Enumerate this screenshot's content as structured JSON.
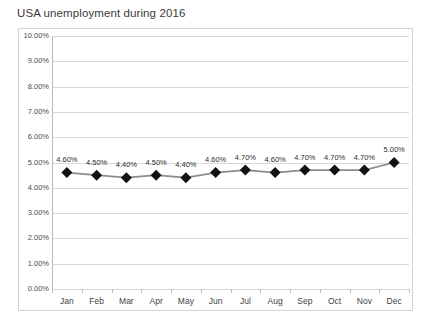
{
  "chart_data": {
    "type": "line",
    "title": "USA unemployment during 2016",
    "xlabel": "",
    "ylabel": "",
    "categories": [
      "Jan",
      "Feb",
      "Mar",
      "Apr",
      "May",
      "Jun",
      "Jul",
      "Aug",
      "Sep",
      "Oct",
      "Nov",
      "Dec"
    ],
    "values": [
      4.6,
      4.5,
      4.4,
      4.5,
      4.4,
      4.6,
      4.7,
      4.6,
      4.7,
      4.7,
      4.7,
      5.0
    ],
    "point_labels": [
      "4.60%",
      "4.50%",
      "4.40%",
      "4.50%",
      "4.40%",
      "4.60%",
      "4.70%",
      "4.60%",
      "4.70%",
      "4.70%",
      "4.70%",
      "5.00%"
    ],
    "ylim": [
      0,
      10
    ],
    "ytick_values": [
      10,
      9,
      8,
      7,
      6,
      5,
      4,
      3,
      2,
      1,
      0
    ],
    "ytick_labels": [
      "10.00%",
      "9.00%",
      "8.00%",
      "7.00%",
      "6.00%",
      "5.00%",
      "4.00%",
      "3.00%",
      "2.00%",
      "1.00%",
      "0.00%"
    ],
    "grid": true,
    "legend": false,
    "legend_position": "none",
    "marker": "diamond",
    "marker_color": "#121212",
    "line_color": "#8c8c8c",
    "gridline_color": "#d9d9d9",
    "plot_border_color": "#d3d3d3",
    "background_color": "#ffffff",
    "title_color": "#3a3a3a",
    "data_label_color": "#2d2d2d"
  }
}
